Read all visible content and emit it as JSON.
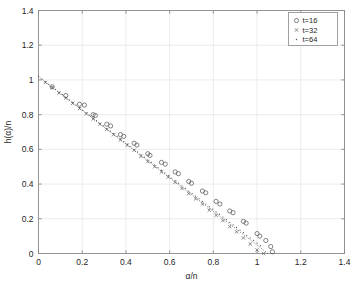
{
  "chart_data": {
    "type": "scatter",
    "title": "",
    "xlabel": "α/n",
    "ylabel": "h(α)/n",
    "xlim": [
      0,
      1.4
    ],
    "ylim": [
      0,
      1.4
    ],
    "xticks": [
      "0",
      "0.2",
      "0.4",
      "0.6",
      "0.8",
      "1",
      "1.2",
      "1.4"
    ],
    "xtick_values": [
      0,
      0.2,
      0.4,
      0.6,
      0.8,
      1.0,
      1.2,
      1.4
    ],
    "yticks": [
      "0",
      "0.2",
      "0.4",
      "0.6",
      "0.8",
      "1",
      "1.2",
      "1.4"
    ],
    "ytick_values": [
      0,
      0.2,
      0.4,
      0.6,
      0.8,
      1.0,
      1.2,
      1.4
    ],
    "grid": true,
    "legend_position": "top-right",
    "series": [
      {
        "name": "t=16",
        "marker": "circle",
        "color": "#595959",
        "x": [
          0.0625,
          0.125,
          0.1875,
          0.21,
          0.25,
          0.26,
          0.3125,
          0.33,
          0.375,
          0.39,
          0.4375,
          0.45,
          0.5,
          0.51,
          0.5625,
          0.58,
          0.625,
          0.64,
          0.6875,
          0.7,
          0.75,
          0.765,
          0.8125,
          0.83,
          0.875,
          0.89,
          0.9375,
          0.95,
          1.0,
          1.0125,
          1.04,
          1.0625,
          1.07
        ],
        "y": [
          0.96,
          0.91,
          0.86,
          0.855,
          0.8,
          0.795,
          0.745,
          0.735,
          0.685,
          0.675,
          0.635,
          0.625,
          0.575,
          0.565,
          0.525,
          0.515,
          0.47,
          0.46,
          0.415,
          0.405,
          0.36,
          0.35,
          0.3,
          0.285,
          0.245,
          0.235,
          0.185,
          0.175,
          0.115,
          0.1,
          0.075,
          0.04,
          0.01
        ]
      },
      {
        "name": "t=32",
        "marker": "x",
        "color": "#595959",
        "x": [
          0.03125,
          0.0625,
          0.09375,
          0.125,
          0.15625,
          0.1875,
          0.21875,
          0.25,
          0.28125,
          0.3125,
          0.34375,
          0.375,
          0.40625,
          0.4375,
          0.46875,
          0.5,
          0.53125,
          0.5625,
          0.59375,
          0.625,
          0.65625,
          0.6875,
          0.71875,
          0.75,
          0.78125,
          0.8125,
          0.84375,
          0.875,
          0.90625,
          0.9375,
          0.96875,
          1.0,
          1.03
        ],
        "y": [
          0.985,
          0.955,
          0.925,
          0.895,
          0.865,
          0.835,
          0.805,
          0.775,
          0.745,
          0.715,
          0.685,
          0.655,
          0.625,
          0.595,
          0.56,
          0.53,
          0.5,
          0.47,
          0.44,
          0.41,
          0.375,
          0.345,
          0.315,
          0.285,
          0.25,
          0.22,
          0.19,
          0.155,
          0.125,
          0.09,
          0.055,
          0.02,
          0.0
        ]
      },
      {
        "name": "t=64",
        "marker": "dot",
        "color": "#595959",
        "x": [
          0.0,
          0.015625,
          0.03125,
          0.046875,
          0.0625,
          0.078125,
          0.09375,
          0.109375,
          0.125,
          0.140625,
          0.15625,
          0.171875,
          0.1875,
          0.203125,
          0.21875,
          0.234375,
          0.25,
          0.265625,
          0.28125,
          0.296875,
          0.3125,
          0.328125,
          0.34375,
          0.359375,
          0.375,
          0.390625,
          0.40625,
          0.421875,
          0.4375,
          0.453125,
          0.46875,
          0.484375,
          0.5,
          0.515625,
          0.53125,
          0.546875,
          0.5625,
          0.578125,
          0.59375,
          0.609375,
          0.625,
          0.640625,
          0.65625,
          0.671875,
          0.6875,
          0.703125,
          0.71875,
          0.734375,
          0.75,
          0.765625,
          0.78125,
          0.796875,
          0.8125,
          0.828125,
          0.84375,
          0.859375,
          0.875,
          0.890625,
          0.90625,
          0.921875,
          0.9375,
          0.953125,
          0.96875,
          0.984375,
          1.0,
          1.015625
        ],
        "y": [
          1.02,
          1.005,
          0.99,
          0.975,
          0.96,
          0.945,
          0.93,
          0.915,
          0.9,
          0.885,
          0.87,
          0.855,
          0.84,
          0.825,
          0.81,
          0.795,
          0.78,
          0.765,
          0.75,
          0.735,
          0.72,
          0.705,
          0.69,
          0.675,
          0.66,
          0.645,
          0.63,
          0.615,
          0.6,
          0.585,
          0.57,
          0.555,
          0.54,
          0.525,
          0.51,
          0.495,
          0.48,
          0.465,
          0.45,
          0.435,
          0.42,
          0.405,
          0.39,
          0.375,
          0.36,
          0.345,
          0.33,
          0.315,
          0.3,
          0.285,
          0.27,
          0.255,
          0.24,
          0.225,
          0.21,
          0.195,
          0.18,
          0.165,
          0.15,
          0.135,
          0.12,
          0.105,
          0.09,
          0.075,
          0.06,
          0.045
        ]
      }
    ],
    "reference_line": {
      "style": "dotted",
      "from": [
        0,
        1.02
      ],
      "to": [
        1.05,
        0.0
      ],
      "color": "#4d4d4d"
    }
  },
  "legend": {
    "entries": [
      {
        "label": "t=16",
        "marker": "circle"
      },
      {
        "label": "t=32",
        "marker": "x"
      },
      {
        "label": "t=64",
        "marker": "dot"
      }
    ]
  },
  "axes": {
    "x_title": "α/n",
    "y_title": "h(α)/n"
  }
}
